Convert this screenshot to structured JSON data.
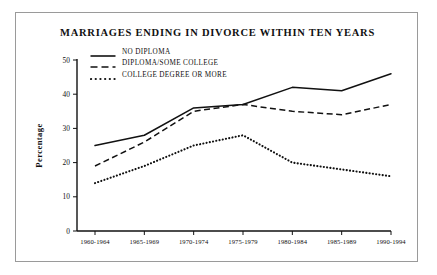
{
  "chart_data": {
    "type": "line",
    "title": "MARRIAGES ENDING IN DIVORCE WITHIN TEN YEARS",
    "xlabel": "",
    "ylabel": "Percentage",
    "categories": [
      "1960-1964",
      "1965-1969",
      "1970-1974",
      "1975-1979",
      "1980-1984",
      "1985-1989",
      "1990-1994"
    ],
    "ylim": [
      0,
      50
    ],
    "yticks": [
      0,
      10,
      20,
      30,
      40,
      50
    ],
    "ytick_labels": [
      "0",
      "10",
      "20",
      "30",
      "40",
      "50"
    ],
    "grid": false,
    "legend_position": "top-left-inside",
    "series": [
      {
        "name": "NO DIPLOMA",
        "style": "solid",
        "color": "#111111",
        "values": [
          25,
          28,
          36,
          37,
          42,
          41,
          46
        ]
      },
      {
        "name": "DIPLOMA/SOME COLLEGE",
        "style": "dashed",
        "color": "#111111",
        "values": [
          19,
          26,
          35,
          37,
          35,
          34,
          37
        ]
      },
      {
        "name": "COLLEGE DEGREE OR MORE",
        "style": "dotted",
        "color": "#111111",
        "values": [
          14,
          19,
          25,
          28,
          20,
          18,
          16
        ]
      }
    ]
  },
  "figure": {
    "background_color": "#ffffff",
    "frame_color": "#9a9a9a",
    "ink_color": "#111111"
  }
}
